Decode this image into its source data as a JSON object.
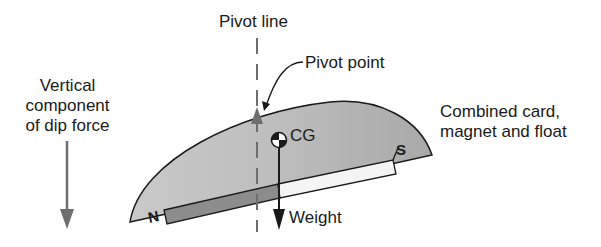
{
  "labels": {
    "pivot_line": "Pivot line",
    "pivot_point": "Pivot point",
    "vertical_component": [
      "Vertical",
      "component",
      "of dip force"
    ],
    "combined": [
      "Combined card,",
      "magnet and float"
    ],
    "cg": "CG",
    "weight": "Weight",
    "north": "N",
    "south": "S"
  },
  "colors": {
    "card_fill": "#b8b8b8",
    "magnet_north": "#8c8c8c",
    "magnet_south": "#f2f2f2",
    "arrow_gray": "#6e6e6e",
    "outline": "#1a1a1a"
  }
}
